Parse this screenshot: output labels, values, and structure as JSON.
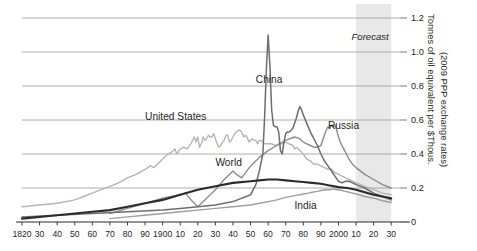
{
  "chart_data": {
    "type": "line",
    "title": "",
    "xlabel": "",
    "ylabel": "Tonnes of oil equivalent per $Thous.",
    "ylabel_line2": "(2009 PPP exchange rates)",
    "xlim": [
      1820,
      2035
    ],
    "ylim": [
      0,
      1.2
    ],
    "grid": true,
    "legend": "inline-labels",
    "y_ticks": [
      0,
      0.2,
      0.4,
      0.6,
      0.8,
      1.0,
      1.2
    ],
    "y_tick_labels": [
      "0",
      "0.2",
      "0.4",
      "0.6",
      "0.8",
      "1.0",
      "1.2"
    ],
    "x_ticks": [
      1820,
      1830,
      1840,
      1850,
      1860,
      1870,
      1880,
      1890,
      1900,
      1910,
      1920,
      1930,
      1940,
      1950,
      1960,
      1970,
      1980,
      1990,
      2000,
      2010,
      2020,
      2030
    ],
    "x_tick_labels": [
      "1820",
      "30",
      "40",
      "50",
      "60",
      "70",
      "80",
      "90",
      "1900",
      "10",
      "20",
      "30",
      "40",
      "50",
      "60",
      "70",
      "80",
      "90",
      "2000",
      "10",
      "20",
      "30"
    ],
    "annotations": [
      {
        "text": "Forecast",
        "x": 2018,
        "y": 1.07,
        "style": "italic"
      }
    ],
    "forecast_band": {
      "start": 2010,
      "end": 2030,
      "color": "#e4e4e4"
    },
    "series": [
      {
        "name": "China",
        "color": "#6e6e6e",
        "width": 1.5,
        "label_x": 1953,
        "label_y": 0.82,
        "points": [
          [
            1820,
            0.03
          ],
          [
            1840,
            0.04
          ],
          [
            1860,
            0.05
          ],
          [
            1880,
            0.06
          ],
          [
            1900,
            0.07
          ],
          [
            1910,
            0.08
          ],
          [
            1920,
            0.09
          ],
          [
            1930,
            0.1
          ],
          [
            1940,
            0.12
          ],
          [
            1950,
            0.16
          ],
          [
            1953,
            0.22
          ],
          [
            1955,
            0.3
          ],
          [
            1957,
            0.4
          ],
          [
            1958,
            0.62
          ],
          [
            1959,
            0.9
          ],
          [
            1960,
            1.1
          ],
          [
            1961,
            0.92
          ],
          [
            1962,
            0.66
          ],
          [
            1963,
            0.57
          ],
          [
            1964,
            0.56
          ],
          [
            1965,
            0.56
          ],
          [
            1966,
            0.53
          ],
          [
            1967,
            0.42
          ],
          [
            1968,
            0.4
          ],
          [
            1969,
            0.47
          ],
          [
            1970,
            0.52
          ],
          [
            1971,
            0.53
          ],
          [
            1972,
            0.53
          ],
          [
            1973,
            0.54
          ],
          [
            1974,
            0.55
          ],
          [
            1975,
            0.58
          ],
          [
            1976,
            0.61
          ],
          [
            1977,
            0.65
          ],
          [
            1978,
            0.68
          ],
          [
            1979,
            0.66
          ],
          [
            1980,
            0.63
          ],
          [
            1982,
            0.58
          ],
          [
            1984,
            0.53
          ],
          [
            1986,
            0.49
          ],
          [
            1988,
            0.45
          ],
          [
            1990,
            0.4
          ],
          [
            1992,
            0.36
          ],
          [
            1994,
            0.33
          ],
          [
            1996,
            0.3
          ],
          [
            1998,
            0.27
          ],
          [
            2000,
            0.24
          ],
          [
            2002,
            0.23
          ],
          [
            2004,
            0.24
          ],
          [
            2006,
            0.24
          ],
          [
            2008,
            0.23
          ],
          [
            2010,
            0.22
          ],
          [
            2015,
            0.2
          ],
          [
            2020,
            0.17
          ],
          [
            2025,
            0.15
          ],
          [
            2030,
            0.13
          ]
        ]
      },
      {
        "name": "Russia",
        "color": "#8c8c8c",
        "width": 1.4,
        "label_x": 1994,
        "label_y": 0.55,
        "points": [
          [
            1870,
            0.05
          ],
          [
            1880,
            0.08
          ],
          [
            1890,
            0.11
          ],
          [
            1900,
            0.14
          ],
          [
            1910,
            0.16
          ],
          [
            1913,
            0.17
          ],
          [
            1917,
            0.12
          ],
          [
            1920,
            0.09
          ],
          [
            1925,
            0.14
          ],
          [
            1930,
            0.19
          ],
          [
            1935,
            0.25
          ],
          [
            1940,
            0.3
          ],
          [
            1942,
            0.28
          ],
          [
            1945,
            0.26
          ],
          [
            1950,
            0.33
          ],
          [
            1955,
            0.38
          ],
          [
            1960,
            0.42
          ],
          [
            1965,
            0.45
          ],
          [
            1970,
            0.48
          ],
          [
            1975,
            0.5
          ],
          [
            1978,
            0.49
          ],
          [
            1980,
            0.47
          ],
          [
            1982,
            0.46
          ],
          [
            1984,
            0.45
          ],
          [
            1986,
            0.44
          ],
          [
            1988,
            0.44
          ],
          [
            1990,
            0.45
          ],
          [
            1991,
            0.48
          ],
          [
            1992,
            0.51
          ],
          [
            1993,
            0.54
          ],
          [
            1994,
            0.56
          ],
          [
            1995,
            0.55
          ],
          [
            1996,
            0.57
          ],
          [
            1997,
            0.56
          ],
          [
            1998,
            0.57
          ],
          [
            1999,
            0.54
          ],
          [
            2000,
            0.5
          ],
          [
            2001,
            0.47
          ],
          [
            2002,
            0.45
          ],
          [
            2003,
            0.43
          ],
          [
            2004,
            0.41
          ],
          [
            2005,
            0.39
          ],
          [
            2006,
            0.37
          ],
          [
            2008,
            0.34
          ],
          [
            2010,
            0.32
          ],
          [
            2015,
            0.28
          ],
          [
            2020,
            0.25
          ],
          [
            2025,
            0.22
          ],
          [
            2030,
            0.2
          ]
        ]
      },
      {
        "name": "United States",
        "color": "#b5b5b5",
        "width": 1.4,
        "label_x": 1890,
        "label_y": 0.6,
        "points": [
          [
            1820,
            0.09
          ],
          [
            1830,
            0.1
          ],
          [
            1840,
            0.11
          ],
          [
            1850,
            0.13
          ],
          [
            1855,
            0.15
          ],
          [
            1860,
            0.17
          ],
          [
            1865,
            0.19
          ],
          [
            1870,
            0.21
          ],
          [
            1875,
            0.23
          ],
          [
            1880,
            0.26
          ],
          [
            1885,
            0.28
          ],
          [
            1890,
            0.31
          ],
          [
            1893,
            0.33
          ],
          [
            1895,
            0.32
          ],
          [
            1898,
            0.35
          ],
          [
            1900,
            0.37
          ],
          [
            1903,
            0.4
          ],
          [
            1905,
            0.41
          ],
          [
            1907,
            0.43
          ],
          [
            1908,
            0.4
          ],
          [
            1910,
            0.43
          ],
          [
            1912,
            0.44
          ],
          [
            1914,
            0.43
          ],
          [
            1916,
            0.46
          ],
          [
            1918,
            0.5
          ],
          [
            1919,
            0.47
          ],
          [
            1920,
            0.5
          ],
          [
            1921,
            0.44
          ],
          [
            1922,
            0.46
          ],
          [
            1923,
            0.5
          ],
          [
            1924,
            0.48
          ],
          [
            1925,
            0.49
          ],
          [
            1926,
            0.51
          ],
          [
            1927,
            0.5
          ],
          [
            1928,
            0.5
          ],
          [
            1929,
            0.52
          ],
          [
            1930,
            0.49
          ],
          [
            1931,
            0.46
          ],
          [
            1932,
            0.44
          ],
          [
            1933,
            0.45
          ],
          [
            1934,
            0.47
          ],
          [
            1935,
            0.48
          ],
          [
            1936,
            0.51
          ],
          [
            1937,
            0.51
          ],
          [
            1938,
            0.47
          ],
          [
            1939,
            0.48
          ],
          [
            1940,
            0.5
          ],
          [
            1941,
            0.52
          ],
          [
            1942,
            0.53
          ],
          [
            1943,
            0.54
          ],
          [
            1944,
            0.54
          ],
          [
            1945,
            0.53
          ],
          [
            1946,
            0.5
          ],
          [
            1947,
            0.51
          ],
          [
            1948,
            0.5
          ],
          [
            1949,
            0.47
          ],
          [
            1950,
            0.48
          ],
          [
            1951,
            0.49
          ],
          [
            1952,
            0.48
          ],
          [
            1953,
            0.48
          ],
          [
            1954,
            0.46
          ],
          [
            1955,
            0.48
          ],
          [
            1956,
            0.48
          ],
          [
            1957,
            0.47
          ],
          [
            1958,
            0.46
          ],
          [
            1959,
            0.46
          ],
          [
            1960,
            0.46
          ],
          [
            1962,
            0.46
          ],
          [
            1964,
            0.45
          ],
          [
            1966,
            0.46
          ],
          [
            1968,
            0.46
          ],
          [
            1970,
            0.47
          ],
          [
            1972,
            0.46
          ],
          [
            1974,
            0.45
          ],
          [
            1975,
            0.43
          ],
          [
            1976,
            0.44
          ],
          [
            1978,
            0.42
          ],
          [
            1980,
            0.4
          ],
          [
            1982,
            0.37
          ],
          [
            1984,
            0.36
          ],
          [
            1986,
            0.34
          ],
          [
            1988,
            0.34
          ],
          [
            1990,
            0.33
          ],
          [
            1992,
            0.32
          ],
          [
            1994,
            0.31
          ],
          [
            1996,
            0.31
          ],
          [
            1998,
            0.29
          ],
          [
            2000,
            0.28
          ],
          [
            2002,
            0.27
          ],
          [
            2004,
            0.26
          ],
          [
            2006,
            0.25
          ],
          [
            2008,
            0.24
          ],
          [
            2010,
            0.23
          ],
          [
            2015,
            0.21
          ],
          [
            2020,
            0.19
          ],
          [
            2025,
            0.17
          ],
          [
            2030,
            0.16
          ]
        ]
      },
      {
        "name": "World",
        "color": "#2b2b2b",
        "width": 2.1,
        "label_x": 1930,
        "label_y": 0.33,
        "points": [
          [
            1820,
            0.02
          ],
          [
            1840,
            0.04
          ],
          [
            1860,
            0.06
          ],
          [
            1870,
            0.07
          ],
          [
            1880,
            0.09
          ],
          [
            1890,
            0.11
          ],
          [
            1900,
            0.13
          ],
          [
            1910,
            0.16
          ],
          [
            1920,
            0.19
          ],
          [
            1930,
            0.21
          ],
          [
            1940,
            0.23
          ],
          [
            1950,
            0.24
          ],
          [
            1955,
            0.245
          ],
          [
            1960,
            0.25
          ],
          [
            1965,
            0.25
          ],
          [
            1970,
            0.245
          ],
          [
            1975,
            0.24
          ],
          [
            1980,
            0.235
          ],
          [
            1985,
            0.23
          ],
          [
            1990,
            0.225
          ],
          [
            1995,
            0.215
          ],
          [
            2000,
            0.205
          ],
          [
            2005,
            0.2
          ],
          [
            2010,
            0.19
          ],
          [
            2015,
            0.175
          ],
          [
            2020,
            0.16
          ],
          [
            2025,
            0.15
          ],
          [
            2030,
            0.14
          ]
        ]
      },
      {
        "name": "India",
        "color": "#9e9e9e",
        "width": 1.4,
        "label_x": 1975,
        "label_y": 0.075,
        "points": [
          [
            1870,
            0.02
          ],
          [
            1880,
            0.03
          ],
          [
            1890,
            0.04
          ],
          [
            1900,
            0.05
          ],
          [
            1910,
            0.06
          ],
          [
            1920,
            0.07
          ],
          [
            1930,
            0.08
          ],
          [
            1940,
            0.09
          ],
          [
            1950,
            0.1
          ],
          [
            1955,
            0.11
          ],
          [
            1960,
            0.12
          ],
          [
            1965,
            0.13
          ],
          [
            1970,
            0.145
          ],
          [
            1975,
            0.155
          ],
          [
            1978,
            0.16
          ],
          [
            1980,
            0.165
          ],
          [
            1983,
            0.17
          ],
          [
            1985,
            0.175
          ],
          [
            1988,
            0.18
          ],
          [
            1990,
            0.185
          ],
          [
            1993,
            0.19
          ],
          [
            1995,
            0.19
          ],
          [
            1997,
            0.195
          ],
          [
            1999,
            0.19
          ],
          [
            2000,
            0.19
          ],
          [
            2002,
            0.185
          ],
          [
            2004,
            0.18
          ],
          [
            2006,
            0.175
          ],
          [
            2008,
            0.17
          ],
          [
            2010,
            0.165
          ],
          [
            2015,
            0.15
          ],
          [
            2020,
            0.14
          ],
          [
            2025,
            0.125
          ],
          [
            2030,
            0.115
          ]
        ]
      }
    ]
  },
  "axis": {
    "right_title_line1": "Tonnes of oil equivalent per $Thous.",
    "right_title_line2": "(2009 PPP exchange rates)"
  },
  "labels": {
    "china": "China",
    "russia": "Russia",
    "united_states": "United States",
    "world": "World",
    "india": "India",
    "forecast": "Forecast"
  }
}
